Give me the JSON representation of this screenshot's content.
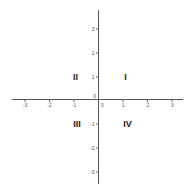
{
  "diagram": {
    "type": "cartesian-coordinate-plane",
    "x_axis": {
      "ticks": [
        {
          "value": -3,
          "label": "-3"
        },
        {
          "value": -2,
          "label": "-2"
        },
        {
          "value": -1,
          "label": "-1"
        },
        {
          "value": 0,
          "label": "0"
        },
        {
          "value": 1,
          "label": "1"
        },
        {
          "value": 2,
          "label": "2"
        },
        {
          "value": 3,
          "label": "3"
        }
      ],
      "range": [
        -3.5,
        3.5
      ]
    },
    "y_axis": {
      "ticks": [
        {
          "value": 3,
          "label": "3"
        },
        {
          "value": 2,
          "label": "2"
        },
        {
          "value": 1,
          "label": "1"
        },
        {
          "value": 0,
          "label": "0"
        },
        {
          "value": -1,
          "label": "-1"
        },
        {
          "value": -2,
          "label": "-2"
        },
        {
          "value": -3,
          "label": "-3"
        }
      ],
      "range": [
        -3.5,
        3.7
      ]
    },
    "quadrants": {
      "q1": "I",
      "q2": "II",
      "q3": "III",
      "q4": "IV"
    },
    "colors": {
      "axis": "#555555",
      "label": "#222222",
      "background": "#ffffff"
    }
  }
}
